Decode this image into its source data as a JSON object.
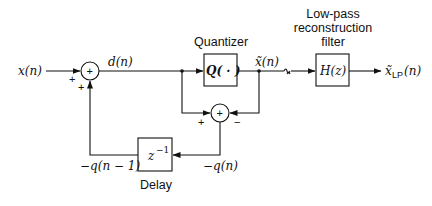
{
  "diagram": {
    "type": "block-diagram",
    "signals": {
      "input": "x(n)",
      "difference": "d(n)",
      "quantized": "x̃(n)",
      "output_var": "x̃",
      "output_sub": "LP",
      "output_arg": "(n)",
      "neg_error": "−q(n)",
      "neg_error_delayed": "−q(n − 1)"
    },
    "blocks": {
      "quantizer": {
        "label": "Quantizer",
        "expr": "Q( · )"
      },
      "filter": {
        "label_lines": [
          "Low-pass",
          "reconstruction",
          "filter"
        ],
        "expr": "H(z)"
      },
      "delay": {
        "label": "Delay",
        "expr_base": "z",
        "expr_exp": "−1"
      }
    },
    "junctions": {
      "sum1": {
        "symbol": "+",
        "signs": [
          "+",
          "+"
        ]
      },
      "sum2": {
        "symbol": "+",
        "signs": [
          "+",
          "−"
        ]
      }
    }
  }
}
